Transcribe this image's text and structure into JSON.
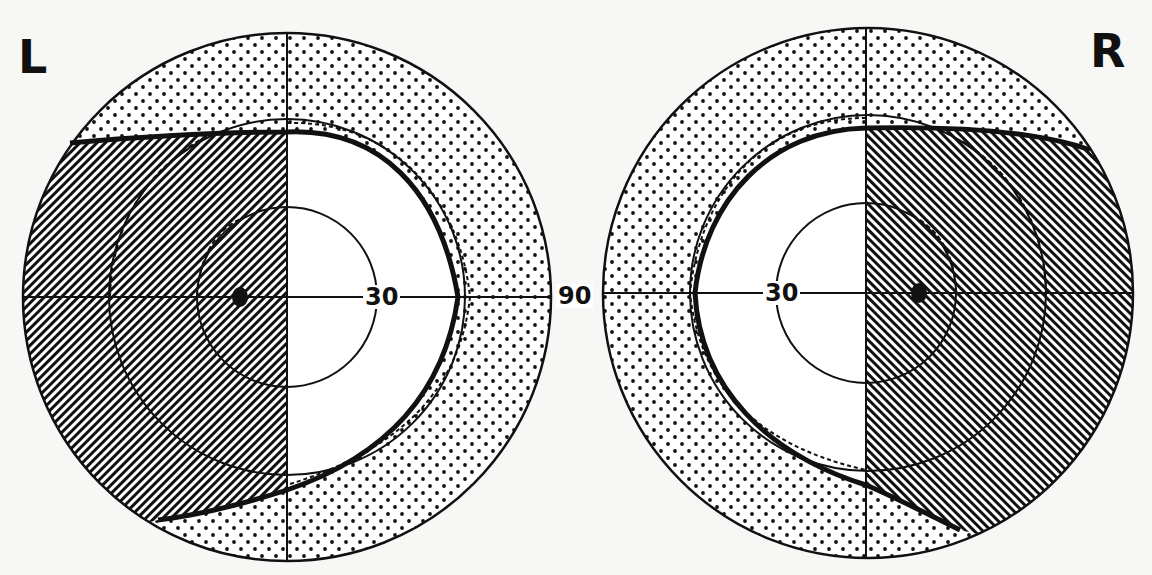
{
  "figure": {
    "type": "visual-field-perimetry",
    "left_eye": {
      "label": "L",
      "degree_label_inner": "30",
      "hatched_side": "left (temporal)",
      "hatch_direction": "forward-slash"
    },
    "right_eye": {
      "label": "R",
      "degree_label_inner": "30",
      "hatched_side": "right (temporal)",
      "hatch_direction": "back-slash"
    },
    "center_label": "90",
    "rings_degrees": [
      30,
      60,
      90
    ],
    "legend": {
      "hatched": "field defect (scotoma)",
      "dotted": "peripheral field beyond isopter",
      "white": "preserved field"
    },
    "colors": {
      "ink": "#111111",
      "paper": "#f7f7f5"
    }
  }
}
